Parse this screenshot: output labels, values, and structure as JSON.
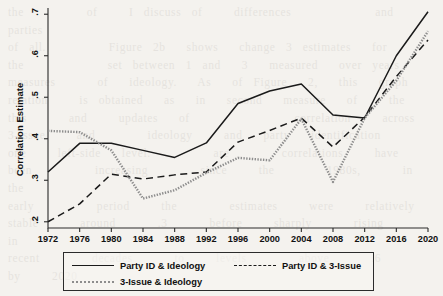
{
  "figure": {
    "background_color": "#f4f2ee",
    "axis_color": "#2b2b2b",
    "bleed_text": "the      of   I discuss of   differences        and   parties\nof all.      Figure 2b  shows  change 3 estimates  for\nthe        set between 1 and  3  measured  over years\nmeasures    of  ideology.  As  of Figure  2,  this  graph\nrelation   is obtained  as  in  second  measure  of   the\nthis    and   updates  of          correlation   across\n3-Issue   and     ideology   and  party  identification\none   left-side  level.      are     correlations   have\nbeen      increasing     since   the     1980s,    in   the\nearly      period   the     estimates   were   relatively\nstable    around    .3    before   sharply    rising    in\nrecent     decades    to   levels     above    .6    by   2020"
  },
  "y_axis": {
    "label": "Correlation Estimate",
    "ticks": [
      ".2",
      ".3",
      ".4",
      ".5",
      ".6",
      ".7"
    ]
  },
  "x_axis": {
    "label": "",
    "ticks": [
      "1972",
      "1976",
      "1980",
      "1984",
      "1988",
      "1992",
      "1996",
      "2000",
      "2004",
      "2008",
      "2012",
      "2016",
      "2020"
    ]
  },
  "legend": {
    "items": [
      {
        "label": "Party ID & Ideology",
        "style": "solid",
        "color": "#1a1a1a"
      },
      {
        "label": "Party ID & 3-Issue",
        "style": "dashed",
        "color": "#1a1a1a"
      },
      {
        "label": "3-Issue & Ideology",
        "style": "dotted",
        "color": "#8d8d8d"
      }
    ]
  },
  "chart_data": {
    "type": "line",
    "title": "",
    "xlabel": "",
    "ylabel": "Correlation Estimate",
    "xlim": [
      1972,
      2020
    ],
    "ylim": [
      0.185,
      0.715
    ],
    "grid": false,
    "legend_position": "below-plot",
    "x": [
      1972,
      1976,
      1980,
      1984,
      1988,
      1992,
      1996,
      2000,
      2004,
      2008,
      2012,
      2016,
      2020
    ],
    "series": [
      {
        "name": "Party ID & Ideology",
        "style": "solid",
        "color": "#1a1a1a",
        "values": [
          0.32,
          0.389,
          0.389,
          0.372,
          0.355,
          0.39,
          0.485,
          0.515,
          0.532,
          0.457,
          0.45,
          0.6,
          0.706
        ]
      },
      {
        "name": "Party ID & 3-Issue",
        "style": "dashed",
        "color": "#1a1a1a",
        "values": [
          0.2,
          0.243,
          0.315,
          0.303,
          0.313,
          0.32,
          0.392,
          0.42,
          0.45,
          0.38,
          0.452,
          0.55,
          0.638
        ]
      },
      {
        "name": "3-Issue & Ideology",
        "style": "dotted",
        "color": "#8d8d8d",
        "values": [
          0.419,
          0.416,
          0.372,
          0.256,
          0.276,
          0.318,
          0.354,
          0.348,
          0.448,
          0.296,
          0.45,
          0.54,
          0.659
        ]
      }
    ]
  }
}
